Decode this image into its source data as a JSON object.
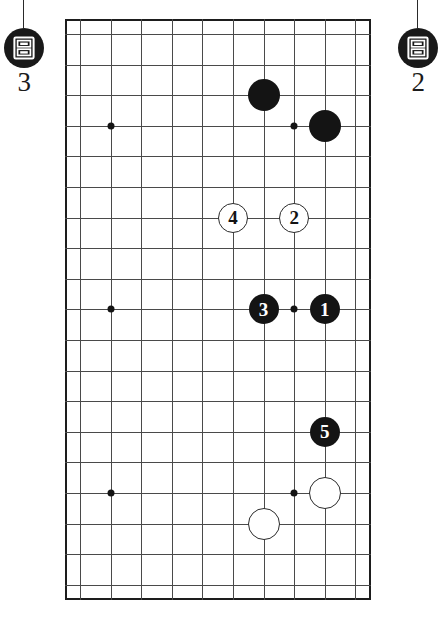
{
  "diagram": {
    "type": "go-board-diagram",
    "board": {
      "columns": 10,
      "rows": 19,
      "cell_size": 30.6,
      "origin_x": 80,
      "origin_y": 34,
      "line_color": "#4a4a4a",
      "border_color": "#1d1d1d",
      "background": "#ffffff"
    },
    "star_points": [
      {
        "name": "hoshi-left-top",
        "col": 1,
        "row": 3
      },
      {
        "name": "hoshi-left-middle",
        "col": 1,
        "row": 9
      },
      {
        "name": "hoshi-left-bottom",
        "col": 1,
        "row": 15
      },
      {
        "name": "hoshi-right-top",
        "col": 7,
        "row": 3
      },
      {
        "name": "hoshi-right-middle",
        "col": 7,
        "row": 9
      },
      {
        "name": "hoshi-right-bottom",
        "col": 7,
        "row": 15
      }
    ],
    "stones": [
      {
        "id": "stone-black-a",
        "color": "black",
        "label": "",
        "col": 6,
        "row": 2,
        "radius": 16
      },
      {
        "id": "stone-black-b",
        "color": "black",
        "label": "",
        "col": 8,
        "row": 3,
        "radius": 16
      },
      {
        "id": "stone-move-4",
        "color": "white",
        "label": "4",
        "col": 5,
        "row": 6,
        "radius": 15
      },
      {
        "id": "stone-move-2",
        "color": "white",
        "label": "2",
        "col": 7,
        "row": 6,
        "radius": 15
      },
      {
        "id": "stone-move-3",
        "color": "black",
        "label": "3",
        "col": 6,
        "row": 9,
        "radius": 15
      },
      {
        "id": "stone-move-1",
        "color": "black",
        "label": "1",
        "col": 8,
        "row": 9,
        "radius": 15
      },
      {
        "id": "stone-move-5",
        "color": "black",
        "label": "5",
        "col": 8,
        "row": 13,
        "radius": 15
      },
      {
        "id": "stone-white-a",
        "color": "white",
        "label": "",
        "col": 8,
        "row": 15,
        "radius": 16
      },
      {
        "id": "stone-white-b",
        "color": "white",
        "label": "",
        "col": 6,
        "row": 16,
        "radius": 16
      }
    ],
    "markers": [
      {
        "id": "marker-left",
        "number": "3",
        "icon": "archive-box-icon",
        "x": 2,
        "y": 28,
        "stem_height": 28
      },
      {
        "id": "marker-right",
        "number": "2",
        "icon": "archive-box-icon",
        "x": 396,
        "y": 28,
        "stem_height": 28
      }
    ]
  }
}
